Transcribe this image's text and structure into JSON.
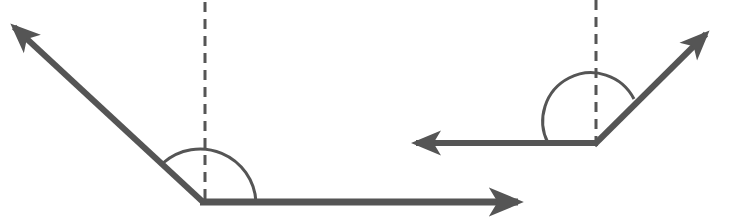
{
  "diagram": {
    "title": "",
    "colors": {
      "stroke": "#555555",
      "background": "#ffffff"
    },
    "figures": [
      {
        "id": "angle-left",
        "vertex": [
          203,
          202
        ],
        "ray_a_tip": [
          12,
          25
        ],
        "ray_b_tip": [
          520,
          202
        ],
        "dashed_line": {
          "top": 0,
          "bottom": 202
        },
        "arc_radius": 52
      },
      {
        "id": "angle-right",
        "vertex": [
          596,
          143
        ],
        "ray_a_tip": [
          413,
          143
        ],
        "ray_b_tip": [
          708,
          32
        ],
        "dashed_line": {
          "top": 0,
          "bottom": 143
        },
        "arc_radius": 48
      }
    ]
  }
}
